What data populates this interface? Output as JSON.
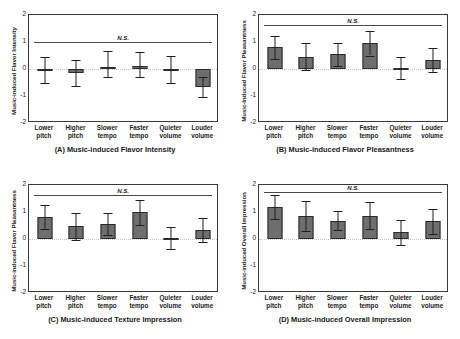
{
  "figure": {
    "panel_count": 4,
    "bar_color": "#6e6e6e",
    "bar_edge_color": "#2b2b2b",
    "error_bar_color": "#1f1f1f"
  },
  "chart_data": [
    {
      "type": "bar",
      "panel": "A",
      "title": "(A) Music-induced Flavor Intensity",
      "ylabel": "Music-induced Flavor Intensity",
      "xlabel": "",
      "categories": [
        "Lower pitch",
        "Higher pitch",
        "Slower tempo",
        "Faster tempo",
        "Quieter volume",
        "Louder volume"
      ],
      "category_lines": [
        [
          "Lower",
          "pitch"
        ],
        [
          "Higher",
          "pitch"
        ],
        [
          "Slower",
          "tempo"
        ],
        [
          "Faster",
          "tempo"
        ],
        [
          "Quieter",
          "volume"
        ],
        [
          "Louder",
          "volume"
        ]
      ],
      "values": [
        -0.03,
        -0.15,
        0.08,
        0.12,
        -0.01,
        -0.65
      ],
      "err_low": [
        -0.52,
        -0.62,
        -0.28,
        -0.3,
        -0.52,
        -1.05
      ],
      "err_high": [
        0.45,
        0.32,
        0.67,
        0.63,
        0.5,
        -0.28
      ],
      "ylim": [
        -2,
        2
      ],
      "yticks": [
        2,
        1,
        0,
        -1,
        -2
      ],
      "ytick_labels": [
        "2",
        "1",
        "0",
        "-1",
        "-2"
      ],
      "annotation": "N.S.",
      "annotation_y": 1.0,
      "grid": false,
      "legend": "none"
    },
    {
      "type": "bar",
      "panel": "B",
      "title": "(B) Music-induced Flavor Pleasantness",
      "ylabel": "Music-Induced Flavor Pleasantness",
      "xlabel": "",
      "categories": [
        "Lower pitch",
        "Higher pitch",
        "Slower tempo",
        "Faster tempo",
        "Quieter volume",
        "Louder volume"
      ],
      "category_lines": [
        [
          "Lower",
          "pitch"
        ],
        [
          "Higher",
          "pitch"
        ],
        [
          "Slower",
          "tempo"
        ],
        [
          "Faster",
          "tempo"
        ],
        [
          "Quieter",
          "volume"
        ],
        [
          "Louder",
          "volume"
        ]
      ],
      "values": [
        0.8,
        0.46,
        0.55,
        0.97,
        0.05,
        0.33
      ],
      "err_low": [
        0.36,
        -0.02,
        0.12,
        0.5,
        -0.36,
        -0.11
      ],
      "err_high": [
        1.22,
        0.95,
        0.95,
        1.42,
        0.45,
        0.77
      ],
      "ylim": [
        -2,
        2
      ],
      "yticks": [
        2,
        1,
        0,
        -1,
        -2
      ],
      "ytick_labels": [
        "2",
        "1",
        "0",
        "-1",
        "-2"
      ],
      "annotation": "N.S.",
      "annotation_y": 1.62,
      "grid": false,
      "legend": "none"
    },
    {
      "type": "bar",
      "panel": "C",
      "title": "(C) Music-induced Texture Impression",
      "ylabel": "Music-induced Flavor Pleasantness",
      "xlabel": "",
      "categories": [
        "Lower pitch",
        "Higher pitch",
        "Slower tempo",
        "Faster tempo",
        "Quieter volume",
        "Louder volume"
      ],
      "category_lines": [
        [
          "Lower",
          "pitch"
        ],
        [
          "Higher",
          "pitch"
        ],
        [
          "Slower",
          "tempo"
        ],
        [
          "Faster",
          "tempo"
        ],
        [
          "Quieter",
          "volume"
        ],
        [
          "Louder",
          "volume"
        ]
      ],
      "values": [
        0.82,
        0.48,
        0.56,
        1.0,
        0.05,
        0.35
      ],
      "err_low": [
        0.38,
        -0.04,
        0.13,
        0.52,
        -0.36,
        -0.1
      ],
      "err_high": [
        1.25,
        0.96,
        0.97,
        1.44,
        0.46,
        0.79
      ],
      "ylim": [
        -2,
        2
      ],
      "yticks": [
        2,
        1,
        0,
        -1,
        -2
      ],
      "ytick_labels": [
        "2",
        "1",
        "0",
        "-1",
        "-2"
      ],
      "annotation": "N.S.",
      "annotation_y": 1.62,
      "grid": false,
      "legend": "none"
    },
    {
      "type": "bar",
      "panel": "D",
      "title": "(D) Music-induced Overall Impression",
      "ylabel": "Music-induced Overall Impression",
      "xlabel": "",
      "categories": [
        "Lower pitch",
        "Higher pitch",
        "Slower tempo",
        "Faster tempo",
        "Quieter volume",
        "Louder volume"
      ],
      "category_lines": [
        [
          "Lower",
          "pitch"
        ],
        [
          "Higher",
          "pitch"
        ],
        [
          "Slower",
          "tempo"
        ],
        [
          "Faster",
          "tempo"
        ],
        [
          "Quieter",
          "volume"
        ],
        [
          "Louder",
          "volume"
        ]
      ],
      "values": [
        1.17,
        0.85,
        0.68,
        0.86,
        0.25,
        0.65
      ],
      "err_low": [
        0.75,
        0.28,
        0.32,
        0.38,
        -0.22,
        0.18
      ],
      "err_high": [
        1.62,
        1.4,
        1.05,
        1.38,
        0.72,
        1.1
      ],
      "ylim": [
        -2,
        2
      ],
      "yticks": [
        2,
        1,
        0,
        -1,
        -2
      ],
      "ytick_labels": [
        "2",
        "1",
        "0",
        "-1",
        "-2"
      ],
      "annotation": "N.S.",
      "annotation_y": 1.75,
      "grid": false,
      "legend": "none"
    }
  ]
}
